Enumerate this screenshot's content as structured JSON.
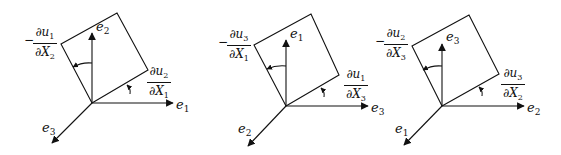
{
  "diagram": {
    "colors": {
      "stroke": "#111111",
      "background": "#ffffff"
    },
    "panels": [
      {
        "id": "panel-1",
        "vertical_axis": {
          "base": "e",
          "sub": "2"
        },
        "horizontal_axis": {
          "base": "e",
          "sub": "1"
        },
        "diagonal_axis": {
          "base": "e",
          "sub": "3"
        },
        "left_angle_label": {
          "sign": "−",
          "num_base": "∂u",
          "num_sub": "1",
          "den_base": "∂X",
          "den_sub": "2"
        },
        "right_angle_label": {
          "num_base": "∂u",
          "num_sub": "2",
          "den_base": "∂X",
          "den_sub": "1"
        }
      },
      {
        "id": "panel-2",
        "vertical_axis": {
          "base": "e",
          "sub": "1"
        },
        "horizontal_axis": {
          "base": "e",
          "sub": "3"
        },
        "diagonal_axis": {
          "base": "e",
          "sub": "2"
        },
        "left_angle_label": {
          "sign": "−",
          "num_base": "∂u",
          "num_sub": "3",
          "den_base": "∂X",
          "den_sub": "1"
        },
        "right_angle_label": {
          "num_base": "∂u",
          "num_sub": "1",
          "den_base": "∂X",
          "den_sub": "3"
        }
      },
      {
        "id": "panel-3",
        "vertical_axis": {
          "base": "e",
          "sub": "3"
        },
        "horizontal_axis": {
          "base": "e",
          "sub": "2"
        },
        "diagonal_axis": {
          "base": "e",
          "sub": "1"
        },
        "left_angle_label": {
          "sign": "−",
          "num_base": "∂u",
          "num_sub": "2",
          "den_base": "∂X",
          "den_sub": "3"
        },
        "right_angle_label": {
          "num_base": "∂u",
          "num_sub": "3",
          "den_base": "∂X",
          "den_sub": "2"
        }
      }
    ]
  }
}
